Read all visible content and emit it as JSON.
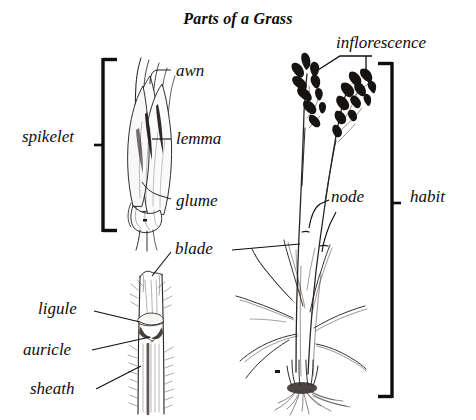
{
  "figure": {
    "title": "Parts of a Grass",
    "ink_color": "#100d0c",
    "background_color": "#ffffff"
  },
  "labels": {
    "awn": "awn",
    "lemma": "lemma",
    "glume": "glume",
    "spikelet": "spikelet",
    "inflorescence": "inflorescence",
    "node": "node",
    "habit": "habit",
    "blade": "blade",
    "ligule": "ligule",
    "auricle": "auricle",
    "sheath": "sheath"
  },
  "brackets": [
    {
      "name": "spikelet-bracket",
      "label": "spikelet",
      "side": "left",
      "top": 58,
      "bottom": 232
    },
    {
      "name": "habit-bracket",
      "label": "habit",
      "side": "right",
      "top": 62,
      "bottom": 398
    }
  ],
  "panels": [
    {
      "name": "spikelet-detail",
      "labels": [
        "awn",
        "lemma",
        "glume",
        "spikelet"
      ]
    },
    {
      "name": "habit-whole-plant",
      "labels": [
        "inflorescence",
        "node",
        "habit"
      ]
    },
    {
      "name": "leaf-collar-detail",
      "labels": [
        "blade",
        "ligule",
        "auricle",
        "sheath"
      ]
    }
  ]
}
